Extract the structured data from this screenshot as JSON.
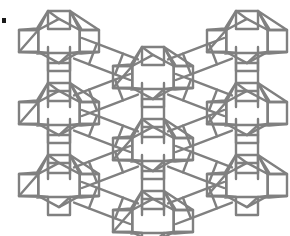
{
  "figure": {
    "type": "lattice-diagram",
    "width": 290,
    "height": 236,
    "background_color": "#ffffff",
    "line_color": "#808080",
    "line_width": 2.4,
    "line_join": "round",
    "line_cap": "round",
    "fill": "none"
  },
  "lattice": {
    "columns": 3,
    "rows": 3,
    "x_pitch": 94,
    "y_pitch": 72,
    "x_origin": 59,
    "y_origin": 41,
    "column_offsets_y": [
      0,
      36,
      0
    ],
    "bridge_length": 28,
    "cage_unit": {
      "name": "truncated-octahedron-cage",
      "hexagon_radius": 24,
      "square_half_width": 11,
      "square_offset": 30,
      "rhombus_offset": 30
    }
  },
  "cages": [
    {
      "col": 0,
      "row": 0,
      "cx": 59,
      "cy": 41
    },
    {
      "col": 0,
      "row": 1,
      "cx": 59,
      "cy": 113
    },
    {
      "col": 0,
      "row": 2,
      "cx": 59,
      "cy": 185
    },
    {
      "col": 1,
      "row": 0,
      "cx": 153,
      "cy": 77
    },
    {
      "col": 1,
      "row": 1,
      "cx": 153,
      "cy": 149
    },
    {
      "col": 1,
      "row": 2,
      "cx": 153,
      "cy": 221
    },
    {
      "col": 2,
      "row": 0,
      "cx": 247,
      "cy": 41
    },
    {
      "col": 2,
      "row": 1,
      "cx": 247,
      "cy": 113
    },
    {
      "col": 2,
      "row": 2,
      "cx": 247,
      "cy": 185
    }
  ],
  "bridges": [
    {
      "from": 0,
      "to": 3,
      "kind": "square-4-ring"
    },
    {
      "from": 1,
      "to": 3,
      "kind": "square-4-ring"
    },
    {
      "from": 1,
      "to": 4,
      "kind": "square-4-ring"
    },
    {
      "from": 2,
      "to": 4,
      "kind": "square-4-ring"
    },
    {
      "from": 2,
      "to": 5,
      "kind": "square-4-ring"
    },
    {
      "from": 6,
      "to": 3,
      "kind": "square-4-ring"
    },
    {
      "from": 7,
      "to": 3,
      "kind": "square-4-ring"
    },
    {
      "from": 7,
      "to": 4,
      "kind": "square-4-ring"
    },
    {
      "from": 8,
      "to": 4,
      "kind": "square-4-ring"
    },
    {
      "from": 8,
      "to": 5,
      "kind": "square-4-ring"
    },
    {
      "from": 0,
      "to": 1,
      "kind": "vertical-square-4-ring"
    },
    {
      "from": 1,
      "to": 2,
      "kind": "vertical-square-4-ring"
    },
    {
      "from": 3,
      "to": 4,
      "kind": "vertical-square-4-ring"
    },
    {
      "from": 4,
      "to": 5,
      "kind": "vertical-square-4-ring"
    },
    {
      "from": 6,
      "to": 7,
      "kind": "vertical-square-4-ring"
    },
    {
      "from": 7,
      "to": 8,
      "kind": "vertical-square-4-ring"
    }
  ],
  "artifact": {
    "name": "scan-mark",
    "x": 2,
    "y": 18,
    "width": 4,
    "height": 5,
    "color": "#1a1a1a"
  }
}
